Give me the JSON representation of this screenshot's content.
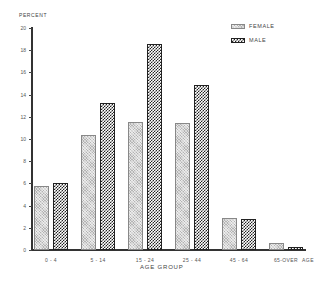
{
  "chart_data": {
    "type": "bar",
    "title": "",
    "xlabel": "AGE GROUP",
    "ylabel": "PERCENT",
    "x_axis_end_label": "AGE",
    "categories": [
      "0 - 4",
      "5 - 14",
      "15 - 24",
      "25 - 44",
      "45 - 64",
      "65-OVER"
    ],
    "series": [
      {
        "name": "FEMALE",
        "values": [
          5.8,
          10.4,
          11.5,
          11.4,
          2.9,
          0.6
        ]
      },
      {
        "name": "MALE",
        "values": [
          6.0,
          13.2,
          18.6,
          14.9,
          2.8,
          0.3
        ]
      }
    ],
    "ylim": [
      0,
      20
    ],
    "yticks": [
      0,
      2,
      4,
      6,
      8,
      10,
      12,
      14,
      16,
      18,
      20
    ],
    "grid": false,
    "legend_position": "top-right"
  },
  "labels": {
    "ylabel": "PERCENT",
    "xlabel": "AGE GROUP",
    "x_end": "AGE",
    "legend_female": "FEMALE",
    "legend_male": "MALE"
  }
}
